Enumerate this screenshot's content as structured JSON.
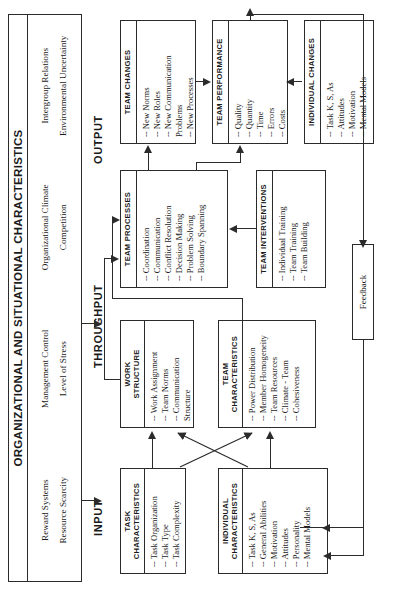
{
  "figure": {
    "banner_title": "ORGANIZATIONAL AND SITUATIONAL CHARACTERISTICS",
    "banner_columns": [
      {
        "items": [
          "Reward Systems",
          "Resource Scarcity"
        ]
      },
      {
        "items": [
          "Management Control",
          "Level of Stress"
        ]
      },
      {
        "items": [
          "Organizational Climate",
          "Competition"
        ]
      },
      {
        "items": [
          "Intergroup Relations",
          "Environmental Uncertainty"
        ]
      }
    ],
    "stages": {
      "input": "INPUT",
      "throughput": "THROUGHPUT",
      "output": "OUTPUT"
    },
    "feedback_label": "Feedback",
    "nodes": {
      "task_characteristics": {
        "title": "TASK\nCHARACTERISTICS",
        "title_line1": "TASK",
        "title_line2": "CHARACTERISTICS",
        "items": [
          "-- Task Organization",
          "-- Task Type",
          "-- Task Complexity"
        ]
      },
      "individual_characteristics": {
        "title_line1": "INDIVIDUAL",
        "title_line2": "CHARACTERISTICS",
        "items": [
          "-- Task K, S, As",
          "-- General Abilities",
          "-- Motivation",
          "-- Attitudes",
          "-- Personality",
          "-- Mental Models"
        ]
      },
      "work_structure": {
        "title_line1": "WORK",
        "title_line2": "STRUCTURE",
        "items": [
          "-- Work Assignment",
          "-- Team Norms",
          "-- Communication",
          "     Structure"
        ]
      },
      "team_characteristics": {
        "title_line1": "TEAM",
        "title_line2": "CHARACTERISTICS",
        "items": [
          "-- Power Distribution",
          "-- Member Homogeneity",
          "-- Team Resources",
          "-- Climate - Team",
          "-- Cohesiveness"
        ]
      },
      "team_processes": {
        "title_line1": "TEAM PROCESSES",
        "title_line2": "",
        "items": [
          "-- Coordination",
          "-- Communication",
          "-- Conflict Resolution",
          "-- Decision Making",
          "-- Problem Solving",
          "-- Boundary Spanning"
        ]
      },
      "team_interventions": {
        "title_line1": "TEAM INTERVENTIONS",
        "title_line2": "",
        "items": [
          "-- Individual Training",
          "-- Team Training",
          "-- Team Building"
        ]
      },
      "team_changes": {
        "title_line1": "TEAM CHANGES",
        "title_line2": "",
        "items": [
          "-- New Norms",
          "-- New Roles",
          "-- New Communication",
          "      Problems",
          "-- New Processes"
        ]
      },
      "team_performance": {
        "title_line1": "TEAM PERFORMANCE",
        "title_line2": "",
        "items": [
          "-- Quality",
          "-- Quantity",
          "-- Time",
          "-- Errors",
          "-- Costs"
        ]
      },
      "individual_changes": {
        "title_line1": "INDIVIDUAL CHANGES",
        "title_line2": "",
        "items": [
          "-- Task K, S, As",
          "-- Attitudes",
          "-- Motivation",
          "-- Mental Models"
        ]
      }
    }
  }
}
